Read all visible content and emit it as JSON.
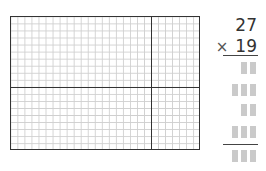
{
  "area_model": {
    "total_columns": 27,
    "total_rows": 19,
    "column_split": [
      20,
      7
    ],
    "row_split": [
      10,
      9
    ]
  },
  "problem": {
    "multiplicand": "27",
    "operator": "×",
    "multiplier": "19"
  },
  "answer_rows": [
    {
      "boxes": 2
    },
    {
      "boxes": 3
    },
    {
      "boxes": 2
    },
    {
      "boxes": 3
    },
    {
      "boxes": 3,
      "is_total": true
    }
  ],
  "colors": {
    "grid_line": "#cfcfcf",
    "outline": "#333333",
    "answer_box": "#cacaca"
  }
}
